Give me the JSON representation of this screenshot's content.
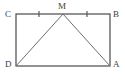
{
  "figure": {
    "canvas": {
      "width": 125,
      "height": 80,
      "background": "#ffffff"
    },
    "style": {
      "rectangle_stroke": "#4a4a4a",
      "rectangle_stroke_width": 1.2,
      "diagonal_stroke": "#6e6e6e",
      "diagonal_stroke_width": 1,
      "tick_stroke": "#5a5a5a",
      "tick_stroke_width": 1.2,
      "label_color": "#3d3d3d",
      "label_font_size": "9px"
    },
    "rectangle": {
      "name": "rectangle-cbad",
      "x": 16,
      "y": 14,
      "width": 94,
      "height": 52
    },
    "points": [
      {
        "id": "C",
        "label": "C",
        "x": 16,
        "y": 14,
        "label_x": 5,
        "label_y": 10
      },
      {
        "id": "B",
        "label": "B",
        "x": 110,
        "y": 14,
        "label_x": 113,
        "label_y": 10
      },
      {
        "id": "D",
        "label": "D",
        "x": 16,
        "y": 66,
        "label_x": 5,
        "label_y": 60
      },
      {
        "id": "A",
        "label": "A",
        "x": 110,
        "y": 66,
        "label_x": 113,
        "label_y": 60
      },
      {
        "id": "M",
        "label": "M",
        "x": 63,
        "y": 14,
        "label_x": 58,
        "label_y": 2
      }
    ],
    "segments": [
      {
        "name": "segment-m-d",
        "x1": 63,
        "y1": 14,
        "x2": 16,
        "y2": 66
      },
      {
        "name": "segment-m-a",
        "x1": 63,
        "y1": 14,
        "x2": 110,
        "y2": 66
      }
    ],
    "tick_marks": [
      {
        "name": "tick-segment-cm",
        "x": 39,
        "y": 14,
        "count": 1
      },
      {
        "name": "tick-segment-mb",
        "x": 87,
        "y": 14,
        "count": 1
      }
    ]
  }
}
